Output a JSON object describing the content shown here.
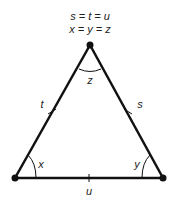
{
  "diagram": {
    "equations": [
      "s = t = u",
      "x = y = z"
    ],
    "side_labels": {
      "left": "t",
      "right": "s",
      "bottom": "u"
    },
    "angle_labels": {
      "top": "z",
      "bottom_left": "x",
      "bottom_right": "y"
    },
    "colors": {
      "stroke": "#111111",
      "text": "#222222"
    }
  }
}
